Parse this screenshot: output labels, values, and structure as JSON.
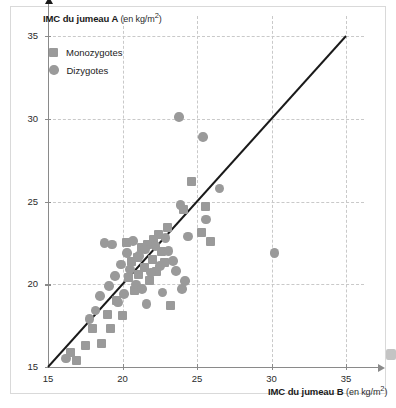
{
  "figure": {
    "background_color": "#ffffff",
    "marker_color": "#9a9a9a",
    "grid_color": "#c9c9c9",
    "axis_color": "#8a8a8a",
    "line_color": "#1a1a1a"
  },
  "chart_data": {
    "type": "scatter",
    "title": "",
    "xlabel": "IMC du jumeau B",
    "xlabel_unit": "(en kg/m2)",
    "ylabel": "IMC du jumeau A",
    "ylabel_unit": "(en kg/m2)",
    "xlim": [
      15,
      36.2
    ],
    "ylim": [
      15,
      36.2
    ],
    "xticks": [
      15,
      20,
      25,
      30,
      35
    ],
    "yticks": [
      15,
      20,
      25,
      30,
      35
    ],
    "xticklabels": [
      "15",
      "20",
      "25",
      "30",
      "35"
    ],
    "yticklabels": [
      "15",
      "20",
      "25",
      "30",
      "35"
    ],
    "grid": true,
    "grid_style": "dashed",
    "legend_position": "upper-left",
    "reference_line": {
      "name": "identity-line",
      "from": [
        15,
        15
      ],
      "to": [
        35,
        35
      ],
      "style": "solid",
      "color": "#1a1a1a"
    },
    "series": [
      {
        "name": "Monozygotes",
        "marker": "square",
        "color": "#9a9a9a",
        "points": [
          [
            16.5,
            15.9
          ],
          [
            16.9,
            15.4
          ],
          [
            17.5,
            16.3
          ],
          [
            18.0,
            17.3
          ],
          [
            18.6,
            16.4
          ],
          [
            19.0,
            18.2
          ],
          [
            19.2,
            17.3
          ],
          [
            19.6,
            19.0
          ],
          [
            20.0,
            18.1
          ],
          [
            20.3,
            22.5
          ],
          [
            20.4,
            20.4
          ],
          [
            20.6,
            21.4
          ],
          [
            20.8,
            19.6
          ],
          [
            21.0,
            21.6
          ],
          [
            21.1,
            20.6
          ],
          [
            21.3,
            22.2
          ],
          [
            21.5,
            21.0
          ],
          [
            21.7,
            22.4
          ],
          [
            21.8,
            20.2
          ],
          [
            22.0,
            21.5
          ],
          [
            22.1,
            22.7
          ],
          [
            22.3,
            20.8
          ],
          [
            22.4,
            23.0
          ],
          [
            22.6,
            22.0
          ],
          [
            22.8,
            21.3
          ],
          [
            23.0,
            23.4
          ],
          [
            23.2,
            18.7
          ],
          [
            24.1,
            24.5
          ],
          [
            24.6,
            26.2
          ],
          [
            25.3,
            23.1
          ],
          [
            25.6,
            24.7
          ],
          [
            25.9,
            22.6
          ]
        ]
      },
      {
        "name": "Dizygotes",
        "marker": "circle",
        "color": "#9a9a9a",
        "points": [
          [
            16.2,
            15.5
          ],
          [
            17.8,
            17.9
          ],
          [
            18.2,
            18.4
          ],
          [
            18.5,
            19.3
          ],
          [
            18.8,
            22.5
          ],
          [
            19.1,
            19.9
          ],
          [
            19.3,
            22.4
          ],
          [
            19.5,
            20.5
          ],
          [
            19.7,
            18.9
          ],
          [
            19.9,
            21.2
          ],
          [
            20.1,
            19.4
          ],
          [
            20.3,
            21.9
          ],
          [
            20.5,
            20.9
          ],
          [
            20.7,
            22.6
          ],
          [
            20.9,
            20.0
          ],
          [
            21.1,
            21.7
          ],
          [
            21.3,
            19.7
          ],
          [
            21.5,
            22.1
          ],
          [
            21.6,
            18.8
          ],
          [
            21.9,
            20.7
          ],
          [
            22.2,
            22.3
          ],
          [
            22.5,
            21.1
          ],
          [
            22.7,
            19.5
          ],
          [
            22.9,
            22.8
          ],
          [
            23.1,
            22.0
          ],
          [
            23.4,
            21.4
          ],
          [
            23.6,
            20.8
          ],
          [
            23.8,
            30.1
          ],
          [
            23.9,
            24.8
          ],
          [
            24.0,
            19.7
          ],
          [
            24.2,
            20.2
          ],
          [
            24.4,
            22.9
          ],
          [
            25.4,
            28.9
          ],
          [
            25.6,
            23.9
          ],
          [
            26.5,
            25.8
          ],
          [
            30.2,
            21.9
          ]
        ]
      }
    ]
  },
  "legend": {
    "items": [
      {
        "label": "Monozygotes",
        "marker": "square"
      },
      {
        "label": "Dizygotes",
        "marker": "circle"
      }
    ]
  }
}
